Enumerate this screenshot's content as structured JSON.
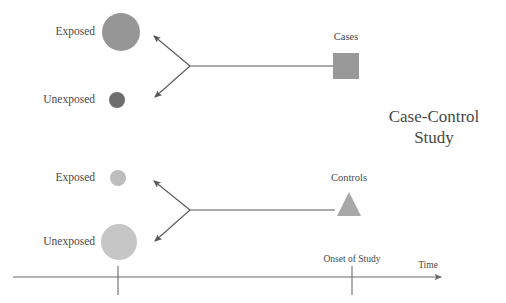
{
  "diagram": {
    "title_line1": "Case-Control",
    "title_line2": "Study",
    "colors": {
      "line": "#595959",
      "text": "#484848",
      "exposed_top_fill": "#969696",
      "unexposed_top_fill": "#6e6e6e",
      "exposed_bottom_fill": "#bdbdbd",
      "unexposed_bottom_fill": "#c6c6c6",
      "cases_fill": "#999999",
      "controls_fill": "#a8a8a8",
      "background": "#ffffff"
    },
    "top_group": {
      "outcome_label": "Cases",
      "outcome_shape": "square",
      "exposed_label": "Exposed",
      "unexposed_label": "Unexposed",
      "exposed_size": "large",
      "unexposed_size": "small"
    },
    "bottom_group": {
      "outcome_label": "Controls",
      "outcome_shape": "triangle",
      "exposed_label": "Exposed",
      "unexposed_label": "Unexposed",
      "exposed_size": "small",
      "unexposed_size": "large"
    },
    "axis": {
      "time_label": "Time",
      "onset_label": "Onset of Study",
      "tick_past_x": 118,
      "tick_onset_x": 352,
      "baseline_y": 277
    }
  }
}
